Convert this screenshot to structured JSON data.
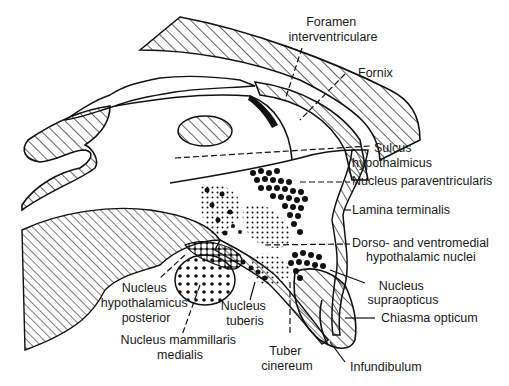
{
  "diagram": {
    "type": "anatomical-diagram",
    "labels": [
      {
        "id": "foramen",
        "lines": [
          "Foramen",
          "interventriculare"
        ]
      },
      {
        "id": "fornix",
        "lines": [
          "Fornix"
        ]
      },
      {
        "id": "sulcus",
        "lines": [
          "Sulcus",
          "hypothalmicus"
        ]
      },
      {
        "id": "paraventricularis",
        "lines": [
          "Nucleus paraventricularis"
        ]
      },
      {
        "id": "lamina",
        "lines": [
          "Lamina terminalis"
        ]
      },
      {
        "id": "dorso",
        "lines": [
          "Dorso- and ventromedial",
          "hypothalamic nuclei"
        ]
      },
      {
        "id": "supraopticus",
        "lines": [
          "Nucleus",
          "supraopticus"
        ]
      },
      {
        "id": "chiasma",
        "lines": [
          "Chiasma opticum"
        ]
      },
      {
        "id": "infundibulum",
        "lines": [
          "Infundibulum"
        ]
      },
      {
        "id": "tuber",
        "lines": [
          "Tuber",
          "cinereum"
        ]
      },
      {
        "id": "tuberis",
        "lines": [
          "Nucleus",
          "tuberis"
        ]
      },
      {
        "id": "mammillaris",
        "lines": [
          "Nucleus mammillaris",
          "medialis"
        ]
      },
      {
        "id": "posterior",
        "lines": [
          "Nucleus",
          "hypothalamicus",
          "posterior"
        ]
      }
    ]
  }
}
